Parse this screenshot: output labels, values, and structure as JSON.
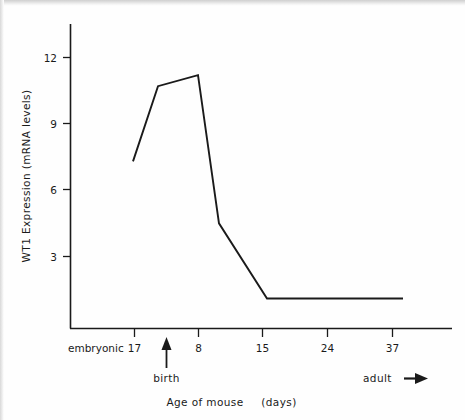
{
  "chart_data": {
    "type": "line",
    "title": "",
    "xlabel": "Age of mouse   (days)",
    "ylabel": "WT1 Expression (mRNA levels)",
    "x_tick_labels": [
      "17",
      "8",
      "15",
      "24",
      "37"
    ],
    "x_category_prefix": "embryonic",
    "y_tick_labels": [
      "3",
      "6",
      "9",
      "12"
    ],
    "y_ticks": [
      3,
      6,
      9,
      12
    ],
    "ylim": [
      0,
      13
    ],
    "grid": false,
    "legend": "none",
    "series": [
      {
        "name": "WT1 expression",
        "x_labels": [
          "embryonic 17",
          "birth",
          "8",
          "~10",
          "15",
          "37"
        ],
        "points": [
          {
            "x_label": "embryonic 17",
            "value": 7.3
          },
          {
            "x_label": "birth",
            "value": 10.7
          },
          {
            "x_label": "8",
            "value": 11.2
          },
          {
            "x_label": "~10",
            "value": 4.5
          },
          {
            "x_label": "15",
            "value": 1.1
          },
          {
            "x_label": "37",
            "value": 1.1
          }
        ]
      }
    ],
    "annotations": [
      {
        "name": "birth-arrow",
        "label": "birth",
        "x_label": "between 17 and 8",
        "direction": "up"
      },
      {
        "name": "adult-arrow",
        "label": "adult",
        "x_label": "after 37",
        "direction": "right"
      }
    ]
  },
  "axes": {
    "y_title": "WT1 Expression (mRNA levels)",
    "x_title_main": "Age of mouse",
    "x_title_unit": "(days)",
    "y_tick_12": "12",
    "y_tick_9": "9",
    "y_tick_6": "6",
    "y_tick_3": "3",
    "x_tick_embryonic": "embryonic",
    "x_tick_17": "17",
    "x_tick_8": "8",
    "x_tick_15": "15",
    "x_tick_24": "24",
    "x_tick_37": "37"
  },
  "annotations": {
    "birth": "birth",
    "adult": "adult"
  },
  "style": {
    "line_color": "#1a1a1a",
    "axis_color": "#1a1a1a",
    "background": "#fefefe"
  }
}
